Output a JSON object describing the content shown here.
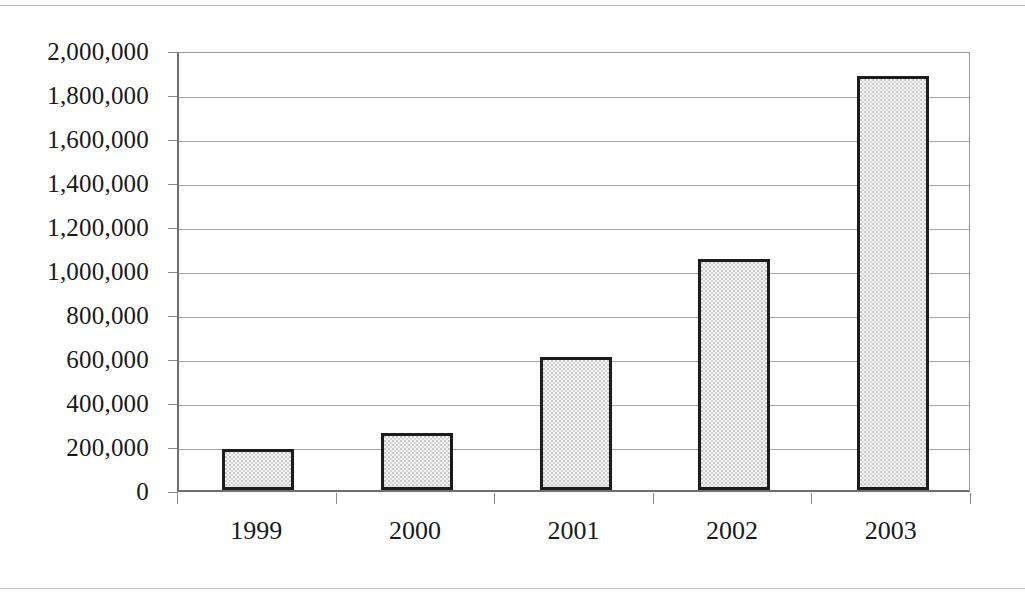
{
  "chart_data": {
    "type": "bar",
    "title": "",
    "xlabel": "",
    "ylabel": "",
    "categories": [
      "1999",
      "2000",
      "2001",
      "2002",
      "2003"
    ],
    "values": [
      185000,
      258000,
      605000,
      1048000,
      1880000
    ],
    "ylim": [
      0,
      2000000
    ],
    "ytick_labels": [
      "2,000,000",
      "1,800,000",
      "1,600,000",
      "1,400,000",
      "1,200,000",
      "1,000,000",
      "800,000",
      "600,000",
      "400,000",
      "200,000",
      "0"
    ],
    "ytick_values": [
      2000000,
      1800000,
      1600000,
      1400000,
      1200000,
      1000000,
      800000,
      600000,
      400000,
      200000,
      0
    ],
    "grid": true,
    "legend": null,
    "legend_position": "none",
    "series": [
      {
        "name": "",
        "values": [
          185000,
          258000,
          605000,
          1048000,
          1880000
        ]
      }
    ],
    "colors": {
      "bar_fill": "#f2f2f2",
      "bar_pattern": "#c9c9c9",
      "bar_border": "#1c1c1c",
      "gridline": "#a6a6a6",
      "axis": "#6f6f6f",
      "text": "#1a1a1a",
      "background": "#ffffff"
    }
  }
}
